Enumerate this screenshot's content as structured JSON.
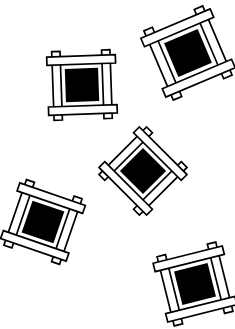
{
  "artwork": {
    "title": "Scattered Lattice Square Motifs",
    "description": "Five decorative hash-frame motifs scattered on a white field",
    "background_color": "#ffffff",
    "ink_color": "#000000",
    "fill_color": "#ffffff",
    "width": 235,
    "height": 329,
    "motif": {
      "name": "lattice-square",
      "bar_count": 4,
      "bar_thickness": 8,
      "bar_overhang": 9,
      "stroke_width": 1.7,
      "frame_span": 48,
      "core_size": 32,
      "core_color": "#000000",
      "bar_fill": "#ffffff",
      "bar_stroke": "#000000"
    },
    "motifs": [
      {
        "id": "motif-top-left",
        "label": "Top left lattice square",
        "cx": 82,
        "cy": 85,
        "rotation": -2,
        "scale": 1.04
      },
      {
        "id": "motif-top-right",
        "label": "Top right lattice square",
        "cx": 188,
        "cy": 53,
        "rotation": -23,
        "scale": 1.14
      },
      {
        "id": "motif-center",
        "label": "Center diamond lattice square",
        "cx": 143,
        "cy": 171,
        "rotation": 45,
        "scale": 1.02
      },
      {
        "id": "motif-bottom-left",
        "label": "Bottom left lattice square",
        "cx": 43,
        "cy": 222,
        "rotation": 19,
        "scale": 1.05
      },
      {
        "id": "motif-bottom-right",
        "label": "Bottom right lattice square",
        "cx": 195,
        "cy": 284,
        "rotation": -14,
        "scale": 1.08
      }
    ]
  }
}
